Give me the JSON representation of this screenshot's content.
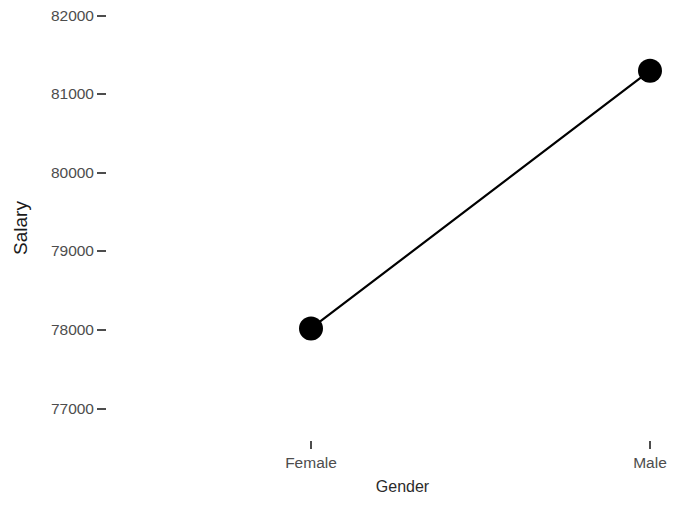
{
  "chart_data": {
    "type": "line",
    "title": "",
    "xlabel": "Gender",
    "ylabel": "Salary",
    "categories": [
      "Female",
      "Male"
    ],
    "values": [
      78020,
      81300
    ],
    "series": [
      {
        "name": "Salary",
        "values": [
          78020,
          81300
        ]
      }
    ],
    "ylim": [
      76600,
      82200
    ],
    "yticks": [
      77000,
      78000,
      79000,
      80000,
      81000,
      82000
    ],
    "ytick_labels": [
      "77000",
      "78000",
      "79000",
      "80000",
      "81000",
      "82000"
    ],
    "xticks": [
      "Female",
      "Male"
    ],
    "grid": false,
    "legend": "none",
    "line_color": "#000000",
    "point_color": "#000000",
    "background_color": "#ffffff",
    "axis_text_color": "#4d4d4d",
    "axis_title_color": "#1a1a1a"
  },
  "axes": {
    "y_title": "Salary",
    "x_title": "Gender"
  }
}
